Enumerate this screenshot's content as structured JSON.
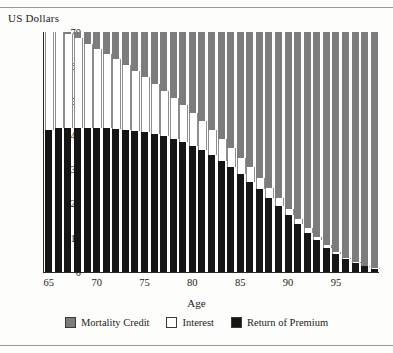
{
  "figure": {
    "y_axis_title": "US Dollars",
    "x_axis_title": "Age"
  },
  "legend": {
    "items": [
      {
        "label": "Mortality Credit",
        "color": "#7c7c7c",
        "key": "mortality_credit"
      },
      {
        "label": "Interest",
        "color": "#ffffff",
        "key": "interest"
      },
      {
        "label": "Return of Premium",
        "color": "#151515",
        "key": "return_of_premium"
      }
    ]
  },
  "chart_data": {
    "type": "bar",
    "stacked": true,
    "title": "",
    "subtitle": "",
    "xlabel": "Age",
    "ylabel": "US Dollars",
    "xlim": [
      65,
      99
    ],
    "ylim": [
      0,
      70
    ],
    "ytick_labels": [
      "0",
      "10",
      "20",
      "30",
      "40",
      "50",
      "60",
      "70"
    ],
    "yticks": [
      0,
      10,
      20,
      30,
      40,
      50,
      60,
      70
    ],
    "xtick_labels": [
      "65",
      "70",
      "75",
      "80",
      "85",
      "90",
      "95"
    ],
    "xticks": [
      65,
      70,
      75,
      80,
      85,
      90,
      95
    ],
    "grid": false,
    "legend_position": "bottom",
    "categories": [
      65,
      66,
      67,
      68,
      69,
      70,
      71,
      72,
      73,
      74,
      75,
      76,
      77,
      78,
      79,
      80,
      81,
      82,
      83,
      84,
      85,
      86,
      87,
      88,
      89,
      90,
      91,
      92,
      93,
      94,
      95,
      96,
      97,
      98,
      99
    ],
    "series": [
      {
        "name": "Return of Premium",
        "color": "#151515",
        "values": [
          41.5,
          42.0,
          42.0,
          42.0,
          42.0,
          42.0,
          42.0,
          41.8,
          41.5,
          41.2,
          40.8,
          40.3,
          39.6,
          38.8,
          37.9,
          36.8,
          35.5,
          34.0,
          32.4,
          30.6,
          28.6,
          26.4,
          24.1,
          21.7,
          19.2,
          16.6,
          14.0,
          11.5,
          9.2,
          7.1,
          5.3,
          3.8,
          2.6,
          1.7,
          1.0
        ]
      },
      {
        "name": "Interest",
        "color": "#ffffff",
        "values": [
          28.5,
          28.0,
          27.4,
          26.2,
          24.5,
          23.0,
          21.6,
          20.2,
          18.8,
          17.4,
          16.0,
          14.6,
          13.3,
          12.0,
          10.8,
          9.6,
          8.5,
          7.5,
          6.5,
          5.6,
          4.8,
          4.1,
          3.4,
          2.8,
          2.3,
          1.9,
          1.5,
          1.2,
          0.9,
          0.7,
          0.5,
          0.4,
          0.3,
          0.2,
          0.1
        ]
      },
      {
        "name": "Mortality Credit",
        "color": "#7c7c7c",
        "values": [
          0.0,
          0.0,
          0.6,
          1.8,
          3.5,
          5.0,
          6.4,
          8.0,
          9.7,
          11.4,
          13.2,
          15.1,
          17.1,
          19.2,
          21.3,
          23.6,
          26.0,
          28.5,
          31.1,
          33.8,
          36.6,
          39.5,
          42.5,
          45.5,
          48.5,
          51.5,
          54.5,
          57.3,
          59.9,
          62.2,
          64.2,
          65.8,
          67.1,
          68.1,
          68.9
        ]
      }
    ],
    "total_per_bar": 70
  }
}
